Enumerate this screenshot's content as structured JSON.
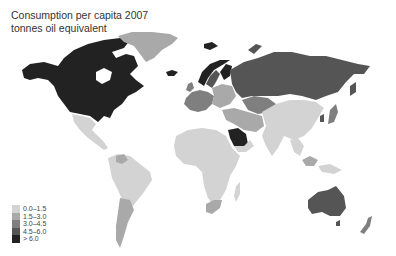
{
  "title": {
    "line1": "Consumption per capita 2007",
    "line2": "tonnes oil equivalent"
  },
  "legend": [
    {
      "label": "0.0–1.5",
      "color": "#d3d3d3"
    },
    {
      "label": "1.5–3.0",
      "color": "#a9a9a9"
    },
    {
      "label": "3.0–4.5",
      "color": "#7f7f7f"
    },
    {
      "label": "4.5–6.0",
      "color": "#555555"
    },
    {
      "label": "> 6.0",
      "color": "#222222"
    }
  ],
  "regions": [
    {
      "name": "Canada",
      "class": "> 6.0"
    },
    {
      "name": "United States",
      "class": "> 6.0"
    },
    {
      "name": "Greenland",
      "class": "1.5–3.0"
    },
    {
      "name": "Iceland",
      "class": "> 6.0"
    },
    {
      "name": "Norway",
      "class": "> 6.0"
    },
    {
      "name": "Sweden",
      "class": "4.5–6.0"
    },
    {
      "name": "Finland",
      "class": "> 6.0"
    },
    {
      "name": "Russia",
      "class": "4.5–6.0"
    },
    {
      "name": "Western Europe",
      "class": "3.0–4.5"
    },
    {
      "name": "Eastern Europe",
      "class": "1.5–3.0"
    },
    {
      "name": "Kazakhstan",
      "class": "3.0–4.5"
    },
    {
      "name": "Central Asia",
      "class": "1.5–3.0"
    },
    {
      "name": "Iran",
      "class": "1.5–3.0"
    },
    {
      "name": "Saudi Arabia",
      "class": "> 6.0"
    },
    {
      "name": "Arabian Peninsula south",
      "class": "0.0–1.5"
    },
    {
      "name": "China",
      "class": "0.0–1.5"
    },
    {
      "name": "India",
      "class": "0.0–1.5"
    },
    {
      "name": "Japan",
      "class": "3.0–4.5"
    },
    {
      "name": "South Korea",
      "class": "4.5–6.0"
    },
    {
      "name": "Southeast Asia",
      "class": "0.0–1.5"
    },
    {
      "name": "Malaysia",
      "class": "1.5–3.0"
    },
    {
      "name": "Mexico",
      "class": "0.0–1.5"
    },
    {
      "name": "Central America",
      "class": "0.0–1.5"
    },
    {
      "name": "Venezuela",
      "class": "1.5–3.0"
    },
    {
      "name": "South America",
      "class": "0.0–1.5"
    },
    {
      "name": "Argentina / Chile",
      "class": "1.5–3.0"
    },
    {
      "name": "Africa",
      "class": "0.0–1.5"
    },
    {
      "name": "South Africa",
      "class": "1.5–3.0"
    },
    {
      "name": "Madagascar",
      "class": "0.0–1.5"
    },
    {
      "name": "Australia",
      "class": "4.5–6.0"
    },
    {
      "name": "New Zealand",
      "class": "3.0–4.5"
    }
  ]
}
